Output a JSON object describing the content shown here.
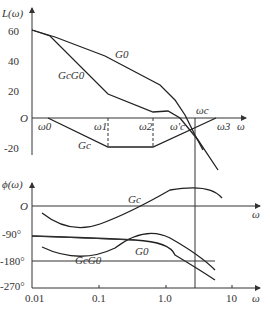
{
  "magnitude_plot": {
    "ylabel": "L(ω)",
    "xlabel": "ω",
    "y_ticks": [
      "60",
      "40",
      "20",
      "O",
      "-20"
    ],
    "freq_labels": [
      "ω0",
      "ω1",
      "ω2",
      "ω'c",
      "ωc",
      "ω3"
    ],
    "curve_labels": {
      "g0": "G0",
      "gcg0": "GcG0",
      "gc": "Gc"
    }
  },
  "phase_plot": {
    "ylabel": "ϕ(ω)",
    "xlabel": "ω",
    "y_ticks": [
      "O",
      "-90°",
      "-180°",
      "-270°"
    ],
    "x_ticks": [
      "0.01",
      "0.1",
      "1.0",
      "10"
    ],
    "curve_labels": {
      "gc": "Gc",
      "g0": "G0",
      "gcg0": "GcG0"
    }
  }
}
